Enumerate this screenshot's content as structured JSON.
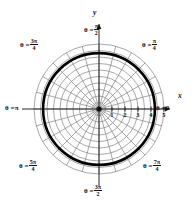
{
  "figure": {
    "kind": "polar-grid-plot",
    "background": "#ffffff",
    "ink": "#101010",
    "grid_color": "#8a8a8a",
    "curve_color": "#000000",
    "center": {
      "x": 99,
      "y": 109
    },
    "unit_px": 13.0,
    "curve": {
      "type": "circle",
      "radius_units": 4.3,
      "stroke_width_px": 2.6
    },
    "grid": {
      "circles_units": [
        0.5,
        1,
        1.5,
        2,
        2.5,
        3,
        3.5,
        4,
        4.5,
        5
      ],
      "ray_count": 24
    }
  },
  "axes": {
    "x_label": "x",
    "y_label": "y",
    "x_ticks": [
      "1",
      "2",
      "3",
      "4",
      "5"
    ],
    "x_tick_units": [
      1,
      2,
      3,
      4,
      5
    ]
  },
  "angle_labels": {
    "right": {
      "theta": "θ =",
      "value": "0",
      "frac": false,
      "num": "",
      "den": ""
    },
    "upper_right": {
      "theta": "θ =",
      "value": "",
      "frac": true,
      "num": "π",
      "den": "4"
    },
    "top": {
      "theta": "θ =",
      "value": "",
      "frac": true,
      "num": "π",
      "den": "2"
    },
    "upper_left": {
      "theta": "θ =",
      "value": "",
      "frac": true,
      "num": "3π",
      "den": "4"
    },
    "left": {
      "theta": "θ =",
      "value": "π",
      "frac": false,
      "num": "",
      "den": ""
    },
    "lower_left": {
      "theta": "θ =",
      "value": "",
      "frac": true,
      "num": "5π",
      "den": "4"
    },
    "bottom": {
      "theta": "θ =",
      "value": "",
      "frac": true,
      "num": "3π",
      "den": "2"
    },
    "lower_right": {
      "theta": "θ =",
      "value": "",
      "frac": true,
      "num": "7π",
      "den": "4"
    }
  },
  "chart_data": {
    "type": "line",
    "title": "",
    "coordinate_system": "polar",
    "xlabel": "x",
    "ylabel": "y",
    "x_tick_labels": [
      "1",
      "2",
      "3",
      "4",
      "5"
    ],
    "radial_ticks": [
      1,
      2,
      3,
      4,
      5
    ],
    "angular_labels": [
      "0",
      "π/4",
      "π/2",
      "3π/4",
      "π",
      "5π/4",
      "3π/2",
      "7π/4"
    ],
    "series": [
      {
        "name": "r = 4",
        "r_constant": 4.3,
        "theta_range": [
          0,
          6.283185307
        ]
      }
    ],
    "grid": true,
    "legend": "none"
  }
}
